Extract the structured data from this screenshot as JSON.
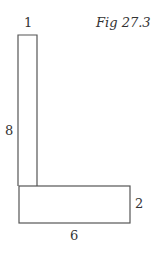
{
  "figure": {
    "caption": "Fig 27.3",
    "shape": "L-shape composed of two rectangles",
    "labels": {
      "top_width": "1",
      "left_height": "8",
      "right_height": "2",
      "bottom_width": "6"
    },
    "stroke_color": "#555555"
  }
}
